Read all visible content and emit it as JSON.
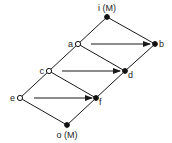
{
  "diagram": {
    "type": "lattice",
    "nodes": [
      {
        "id": "i",
        "label": "i (M)",
        "x": 107,
        "y": 17,
        "style": "filled",
        "label_pos": "top"
      },
      {
        "id": "a",
        "label": "a",
        "x": 78,
        "y": 44,
        "style": "open",
        "label_pos": "left"
      },
      {
        "id": "b",
        "label": "b",
        "x": 155,
        "y": 44,
        "style": "filled",
        "label_pos": "right"
      },
      {
        "id": "c",
        "label": "c",
        "x": 49,
        "y": 71,
        "style": "open",
        "label_pos": "left"
      },
      {
        "id": "d",
        "label": "d",
        "x": 125,
        "y": 71,
        "style": "filled",
        "label_pos": "right-below"
      },
      {
        "id": "e",
        "label": "e",
        "x": 20,
        "y": 98,
        "style": "open",
        "label_pos": "left"
      },
      {
        "id": "f",
        "label": "f",
        "x": 96,
        "y": 98,
        "style": "filled",
        "label_pos": "right-below"
      },
      {
        "id": "o",
        "label": "o (M)",
        "x": 67,
        "y": 125,
        "style": "filled",
        "label_pos": "bottom"
      }
    ],
    "edges": [
      [
        "i",
        "a"
      ],
      [
        "a",
        "c"
      ],
      [
        "c",
        "e"
      ],
      [
        "e",
        "o"
      ],
      [
        "i",
        "b"
      ],
      [
        "b",
        "d"
      ],
      [
        "d",
        "f"
      ],
      [
        "f",
        "o"
      ],
      [
        "a",
        "d"
      ],
      [
        "c",
        "f"
      ]
    ],
    "arrows": [
      {
        "from": "a",
        "to": "b",
        "x1": 91,
        "x2": 150,
        "y": 44
      },
      {
        "from": "c",
        "to": "d",
        "x1": 62,
        "x2": 120,
        "y": 71
      },
      {
        "from": "e",
        "to": "f",
        "x1": 34,
        "x2": 92,
        "y": 98
      }
    ],
    "colors": {
      "line": "#1a1a1a",
      "node": "#111111",
      "background": "#ffffff"
    }
  }
}
